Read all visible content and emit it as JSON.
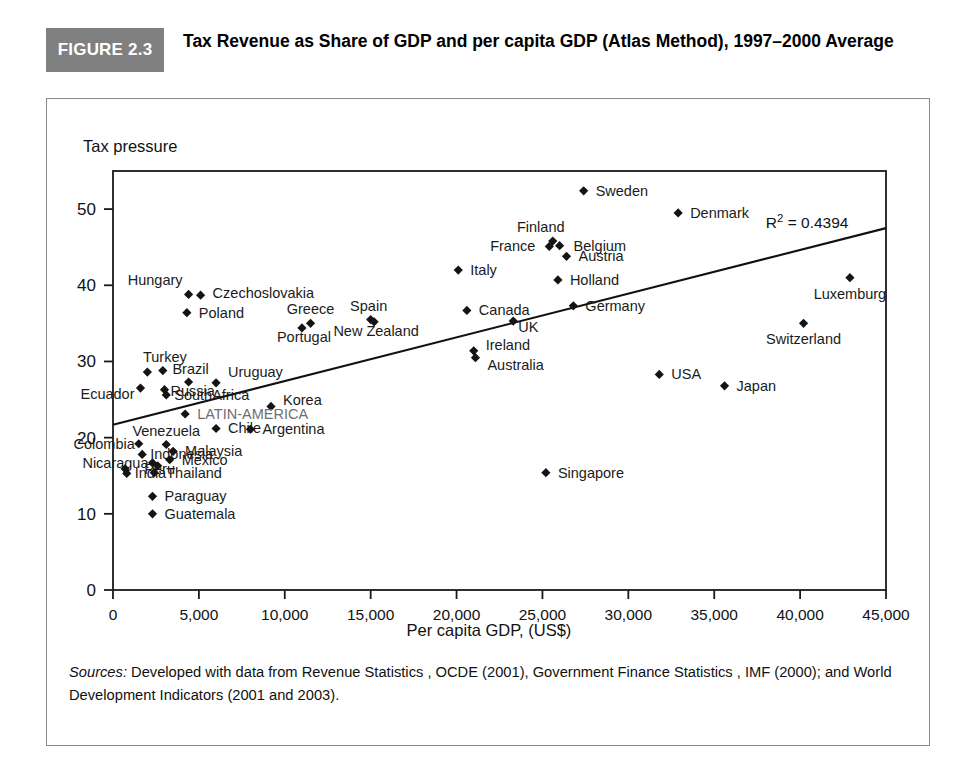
{
  "figure": {
    "badge": "FIGURE 2.3",
    "title": "Tax Revenue as Share of GDP and per capita GDP (Atlas Method), 1997–2000 Average"
  },
  "source": {
    "label": "Sources:",
    "text": " Developed with data from Revenue Statistics , OCDE (2001), Government Finance Statistics , IMF (2000); and World Development Indicators (2001 and 2003)."
  },
  "chart_data": {
    "type": "scatter",
    "title": "Tax Revenue as Share of GDP and per capita GDP (Atlas Method), 1997–2000 Average",
    "xlabel": "Per capita GDP, (US$)",
    "ylabel": "Tax pressure",
    "xlim": [
      0,
      45000
    ],
    "ylim": [
      0,
      55
    ],
    "grid": false,
    "legend": "none",
    "xticks": [
      0,
      5000,
      10000,
      15000,
      20000,
      25000,
      30000,
      35000,
      40000,
      45000
    ],
    "xtick_labels": [
      "0",
      "5,000",
      "10,000",
      "15,000",
      "20,000",
      "25,000",
      "30,000",
      "35,000",
      "40,000",
      "45,000"
    ],
    "yticks": [
      0,
      10,
      20,
      30,
      40,
      50
    ],
    "ytick_labels": [
      "0",
      "10",
      "20",
      "30",
      "40",
      "50"
    ],
    "annotations": [
      {
        "text": "R² = 0.4394",
        "x": 38000,
        "y": 47.5
      }
    ],
    "trendline": {
      "x0": 0,
      "y0": 21.7,
      "x1": 45000,
      "y1": 47.5
    },
    "points": [
      {
        "label": "Sweden",
        "x": 27400,
        "y": 52.4,
        "lx": 12,
        "ly": 5
      },
      {
        "label": "Denmark",
        "x": 32900,
        "y": 49.5,
        "lx": 12,
        "ly": 5
      },
      {
        "label": "Finland",
        "x": 25600,
        "y": 45.8,
        "lx": -12,
        "ly": -9,
        "anchor": "middle"
      },
      {
        "label": "France",
        "x": 25400,
        "y": 45.1,
        "lx": -14,
        "ly": 5,
        "anchor": "end"
      },
      {
        "label": "Belgium",
        "x": 26000,
        "y": 45.2,
        "lx": 14,
        "ly": 5
      },
      {
        "label": "Austria",
        "x": 26400,
        "y": 43.8,
        "lx": 12,
        "ly": 5
      },
      {
        "label": "Italy",
        "x": 20100,
        "y": 42.0,
        "lx": 12,
        "ly": 5
      },
      {
        "label": "Holland",
        "x": 25900,
        "y": 40.7,
        "lx": 12,
        "ly": 5
      },
      {
        "label": "Luxemburg",
        "x": 42900,
        "y": 41.0,
        "lx": 0,
        "ly": 21,
        "anchor": "middle"
      },
      {
        "label": "Hungary",
        "x": 4400,
        "y": 38.8,
        "lx": -6,
        "ly": -9,
        "anchor": "end"
      },
      {
        "label": "Czechoslovakia",
        "x": 5100,
        "y": 38.7,
        "lx": 12,
        "ly": 3
      },
      {
        "label": "Germany",
        "x": 26800,
        "y": 37.3,
        "lx": 12,
        "ly": 5
      },
      {
        "label": "Canada",
        "x": 20600,
        "y": 36.7,
        "lx": 12,
        "ly": 5
      },
      {
        "label": "Poland",
        "x": 4300,
        "y": 36.4,
        "lx": 12,
        "ly": 5
      },
      {
        "label": "UK",
        "x": 23300,
        "y": 35.3,
        "lx": 5,
        "ly": 11
      },
      {
        "label": "Spain",
        "x": 15000,
        "y": 35.5,
        "lx": -2,
        "ly": -9,
        "anchor": "middle"
      },
      {
        "label": "New Zealand",
        "x": 15200,
        "y": 35.2,
        "lx": 2,
        "ly": 14,
        "anchor": "middle"
      },
      {
        "label": "Greece",
        "x": 11500,
        "y": 35.0,
        "lx": 0,
        "ly": -9,
        "anchor": "middle"
      },
      {
        "label": "Portugal",
        "x": 11000,
        "y": 34.4,
        "lx": 2,
        "ly": 14,
        "anchor": "middle"
      },
      {
        "label": "Switzerland",
        "x": 40200,
        "y": 35.0,
        "lx": 0,
        "ly": 21,
        "anchor": "middle"
      },
      {
        "label": "Ireland",
        "x": 21000,
        "y": 31.4,
        "lx": 12,
        "ly": -1
      },
      {
        "label": "Australia",
        "x": 21100,
        "y": 30.5,
        "lx": 12,
        "ly": 12
      },
      {
        "label": "Turkey",
        "x": 2900,
        "y": 28.8,
        "lx": 2,
        "ly": -9,
        "anchor": "middle"
      },
      {
        "label": "",
        "x": 2000,
        "y": 28.6,
        "lx": 0,
        "ly": 0
      },
      {
        "label": "USA",
        "x": 31800,
        "y": 28.3,
        "lx": 12,
        "ly": 5
      },
      {
        "label": "Brazil",
        "x": 4400,
        "y": 27.3,
        "lx": 2,
        "ly": -8,
        "anchor": "middle"
      },
      {
        "label": "Uruguay",
        "x": 6000,
        "y": 27.2,
        "lx": 12,
        "ly": -6
      },
      {
        "label": "Japan",
        "x": 35600,
        "y": 26.8,
        "lx": 12,
        "ly": 5
      },
      {
        "label": "Russia",
        "x": 3000,
        "y": 26.3,
        "lx": 6,
        "ly": 6
      },
      {
        "label": "Ecuador",
        "x": 1600,
        "y": 26.5,
        "lx": -6,
        "ly": 11,
        "anchor": "end"
      },
      {
        "label": "SouthAfrica",
        "x": 3100,
        "y": 25.6,
        "lx": 8,
        "ly": 5
      },
      {
        "label": "Korea",
        "x": 9200,
        "y": 24.1,
        "lx": 12,
        "ly": -1
      },
      {
        "label": "LATIN-AMERICA",
        "x": 4200,
        "y": 23.1,
        "lx": 12,
        "ly": 5,
        "latam": true
      },
      {
        "label": "Chile",
        "x": 6000,
        "y": 21.2,
        "lx": 12,
        "ly": 5
      },
      {
        "label": "Argentina",
        "x": 8000,
        "y": 21.1,
        "lx": 12,
        "ly": 5
      },
      {
        "label": "Venezuela",
        "x": 3100,
        "y": 19.1,
        "lx": 0,
        "ly": -8,
        "anchor": "middle"
      },
      {
        "label": "Colombia",
        "x": 1500,
        "y": 19.2,
        "lx": -4,
        "ly": 5,
        "anchor": "end"
      },
      {
        "label": "Malaysia",
        "x": 3500,
        "y": 18.2,
        "lx": 12,
        "ly": 5
      },
      {
        "label": "Indonesia",
        "x": 1700,
        "y": 17.8,
        "lx": 8,
        "ly": 5
      },
      {
        "label": "Mexico",
        "x": 3300,
        "y": 17.1,
        "lx": 12,
        "ly": 5
      },
      {
        "label": "Nicaragua",
        "x": 2300,
        "y": 16.7,
        "lx": -4,
        "ly": 5,
        "anchor": "end"
      },
      {
        "label": "Peru",
        "x": 2600,
        "y": 16.3,
        "lx": 2,
        "ly": 8,
        "anchor": "middle"
      },
      {
        "label": "Thailand",
        "x": 2400,
        "y": 15.4,
        "lx": 12,
        "ly": 5
      },
      {
        "label": "India",
        "x": 800,
        "y": 15.3,
        "lx": 8,
        "ly": 5
      },
      {
        "label": "",
        "x": 700,
        "y": 15.9,
        "lx": 0,
        "ly": 0
      },
      {
        "label": "Singapore",
        "x": 25200,
        "y": 15.4,
        "lx": 12,
        "ly": 5
      },
      {
        "label": "Paraguay",
        "x": 2300,
        "y": 12.3,
        "lx": 12,
        "ly": 5
      },
      {
        "label": "Guatemala",
        "x": 2300,
        "y": 10.0,
        "lx": 12,
        "ly": 5
      }
    ]
  }
}
